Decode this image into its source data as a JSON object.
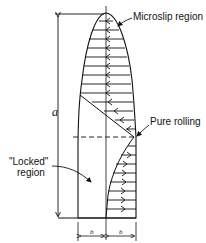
{
  "diagram": {
    "type": "contact-traction-distribution",
    "labels": {
      "microslip": "Microslip region",
      "pure_rolling": "Pure rolling",
      "locked_line1": "\"Locked\"",
      "locked_line2": "region",
      "dim_a": "a",
      "dim_b_left": "b",
      "dim_b_right": "b"
    },
    "arrows": {
      "upper_direction": "left",
      "lower_direction": "right",
      "upper_count": 17,
      "lower_count": 7
    },
    "colors": {
      "ink": "#111111",
      "background": "#ffffff"
    }
  }
}
